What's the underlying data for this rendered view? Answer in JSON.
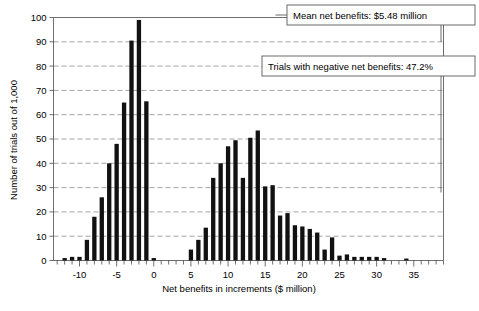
{
  "chart_data": {
    "type": "bar",
    "title": "",
    "subtitle": "",
    "xlabel": "Net benefits in increments ($ million)",
    "ylabel": "Number of trials out of 1,000",
    "xlim": [
      -13.5,
      39
    ],
    "ylim": [
      0,
      100
    ],
    "ytick_values": [
      0,
      10,
      20,
      30,
      40,
      50,
      60,
      70,
      80,
      90,
      100
    ],
    "ytick_labels": [
      "0",
      "10",
      "20",
      "30",
      "40",
      "50",
      "60",
      "70",
      "80",
      "90",
      "100"
    ],
    "xtick_major_values": [
      -10,
      -5,
      0,
      5,
      10,
      15,
      20,
      25,
      30,
      35
    ],
    "xtick_major_labels": [
      "-10",
      "-5",
      "0",
      "5",
      "10",
      "15",
      "20",
      "25",
      "30",
      "35"
    ],
    "xtick_minor_step": 1,
    "grid": "horizontal-dashed",
    "legend": "none",
    "bar_width_fraction": 0.58,
    "categories": [
      -12,
      -11,
      -10,
      -9,
      -8,
      -7,
      -6,
      -5,
      -4,
      -3,
      -2,
      -1,
      0,
      1,
      2,
      3,
      4,
      5,
      6,
      7,
      8,
      9,
      10,
      11,
      12,
      13,
      14,
      15,
      16,
      17,
      18,
      19,
      20,
      21,
      22,
      23,
      24,
      25,
      26,
      27,
      28,
      29,
      30,
      31,
      32,
      33,
      34
    ],
    "values": [
      1,
      1.5,
      1.5,
      8.5,
      18,
      26,
      40,
      48,
      65,
      90.5,
      99,
      65.5,
      1,
      0,
      0,
      0,
      0,
      4.5,
      8.5,
      13.5,
      34,
      40,
      47,
      49.5,
      34,
      50.5,
      53.5,
      30.5,
      31,
      18.5,
      19.5,
      14.5,
      14,
      13,
      11.5,
      4.5,
      9.5,
      2,
      2.5,
      1.5,
      1.5,
      1.5,
      1.5,
      1,
      0,
      0,
      0.8
    ],
    "annotations": [
      {
        "id": "mean-callout",
        "text": "Mean net benefits: $5.48 million",
        "points_to_y": 100
      },
      {
        "id": "negative-callout",
        "text": "Trials with negative net benefits: 47.2%",
        "points_to_y": 80
      }
    ]
  },
  "axes": {
    "y_title": "Number of trials out of 1,000",
    "x_title": "Net benefits in increments ($ million)"
  },
  "colors": {
    "bar": "#111111",
    "grid": "#8c8c8c",
    "axis": "#6e6e6e",
    "box_border": "#5a5a5a",
    "background": "#ffffff",
    "text": "#000000"
  }
}
